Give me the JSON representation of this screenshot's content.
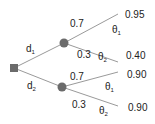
{
  "tree": {
    "decisions": [
      {
        "label": "d",
        "sub": "1"
      },
      {
        "label": "d",
        "sub": "2"
      }
    ],
    "branches": [
      {
        "prob": "0.7",
        "state": "θ",
        "state_sub": "1",
        "value": "0.95"
      },
      {
        "prob": "0.3",
        "state": "θ",
        "state_sub": "2",
        "value": "0.40"
      },
      {
        "prob": "0.7",
        "state": "θ",
        "state_sub": "1",
        "value": "0.90"
      },
      {
        "prob": "0.3",
        "state": "θ",
        "state_sub": "2",
        "value": "0.90"
      }
    ],
    "colors": {
      "line": "#9a9a9a",
      "node": "#6b6b6b"
    }
  }
}
